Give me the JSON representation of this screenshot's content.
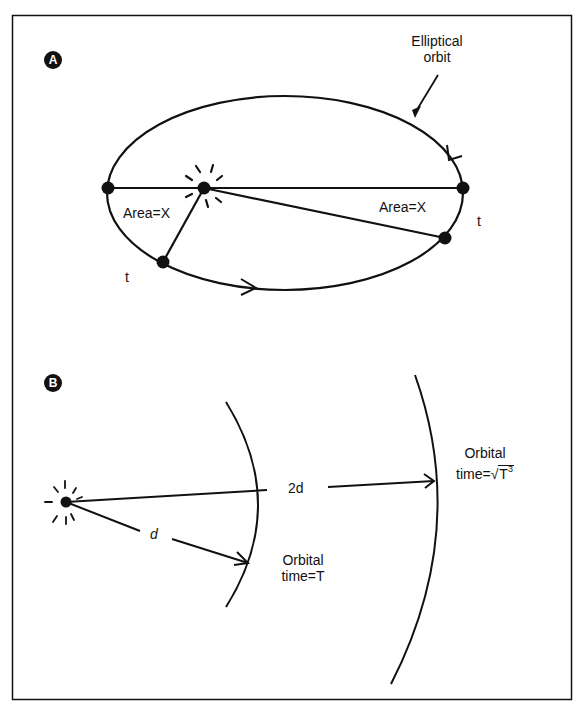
{
  "figure": {
    "panel_a": {
      "badge": "A",
      "orbit_label_line1": "Elliptical",
      "orbit_label_line2": "orbit",
      "area_left": "Area=X",
      "area_right": "Area=X",
      "time_left": "t",
      "time_right": "t"
    },
    "panel_b": {
      "badge": "B",
      "distance_inner": "d",
      "distance_outer": "2d",
      "inner_label_line1": "Orbital",
      "inner_label_line2": "time=T",
      "outer_label_line1": "Orbital",
      "outer_label_prefix": "time=",
      "outer_label_radicand": "T",
      "outer_label_exponent": "3"
    }
  },
  "colors": {
    "ink": "#111111",
    "background": "#ffffff"
  }
}
